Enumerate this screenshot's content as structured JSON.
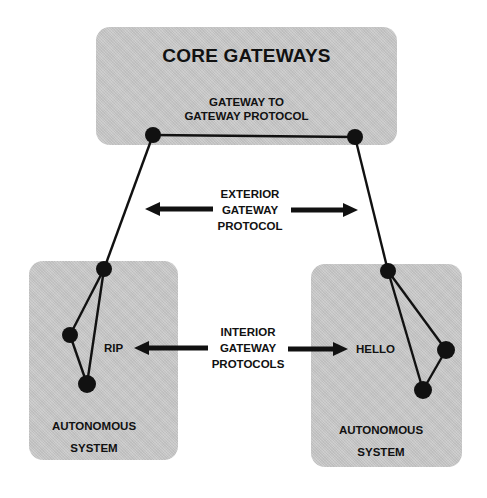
{
  "diagram": {
    "core": {
      "title": "CORE GATEWAYS",
      "protocol_label": [
        "GATEWAY TO",
        "GATEWAY PROTOCOL"
      ]
    },
    "exterior": {
      "label": [
        "EXTERIOR",
        "GATEWAY",
        "PROTOCOL"
      ]
    },
    "interior": {
      "label": [
        "INTERIOR",
        "GATEWAY",
        "PROTOCOLS"
      ]
    },
    "autonomous_left": {
      "protocol": "RIP",
      "label": [
        "AUTONOMOUS",
        "SYSTEM"
      ]
    },
    "autonomous_right": {
      "protocol": "HELLO",
      "label": [
        "AUTONOMOUS",
        "SYSTEM"
      ]
    },
    "colors": {
      "panel_fill": "#c9c9c9",
      "ink": "#111111",
      "background": "#ffffff"
    }
  }
}
